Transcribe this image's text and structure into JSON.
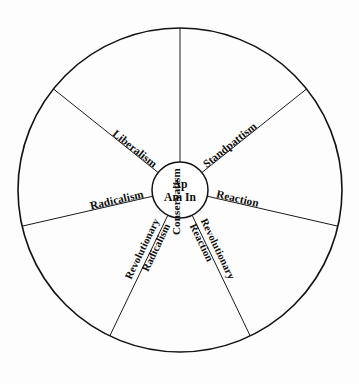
{
  "figure": {
    "name": "political-spectrum-wheel",
    "background_color": "#fdfdfd",
    "line_color": "#121212",
    "text_color": "#0d0d0d"
  },
  "hub": {
    "line1": "Ap",
    "line2": "Am In",
    "center_x": 180,
    "center_y": 190,
    "radius": 28
  },
  "wheel": {
    "center_x": 180,
    "center_y": 190,
    "radius": 162,
    "sector_count": 7
  },
  "sectors": [
    {
      "id": "conservatism",
      "label": "Conservatism",
      "lines": [
        "Conservatism"
      ],
      "spoke_angle_deg": 270,
      "label_rotation_deg": -90,
      "label_x": 180,
      "label_y": 162,
      "label_anchor": "end",
      "label_offset": 6
    },
    {
      "id": "standpattism",
      "label": "Standpattism",
      "lines": [
        "Standpattism"
      ],
      "spoke_angle_deg": 321.4,
      "label_rotation_deg": -38.6,
      "label_x": 202,
      "label_y": 172,
      "label_anchor": "start",
      "label_offset": 6
    },
    {
      "id": "reaction",
      "label": "Reaction",
      "lines": [
        "Reaction"
      ],
      "spoke_angle_deg": 12.9,
      "label_rotation_deg": 12.9,
      "label_x": 210,
      "label_y": 196,
      "label_anchor": "start",
      "label_offset": 6
    },
    {
      "id": "revolutionary-reaction",
      "label": "Revolutionary Reaction",
      "lines": [
        "Revolutionary",
        "Reaction"
      ],
      "spoke_angle_deg": 64.3,
      "label_rotation_deg": 64.3,
      "label_x": 196,
      "label_y": 216,
      "label_anchor": "start",
      "label_offset": 6
    },
    {
      "id": "revolutionary-radicalism",
      "label": "Revolutionary Radicalism",
      "lines": [
        "Revolutionary",
        "Radicalism"
      ],
      "spoke_angle_deg": 115.7,
      "label_rotation_deg": -64.3,
      "label_x": 164,
      "label_y": 216,
      "label_anchor": "end",
      "label_offset": 6
    },
    {
      "id": "radicalism",
      "label": "Radicalism",
      "lines": [
        "Radicalism"
      ],
      "spoke_angle_deg": 167.1,
      "label_rotation_deg": -12.9,
      "label_x": 150,
      "label_y": 196,
      "label_anchor": "end",
      "label_offset": 6
    },
    {
      "id": "liberalism",
      "label": "Liberalism",
      "lines": [
        "Liberalism"
      ],
      "spoke_angle_deg": 218.6,
      "label_rotation_deg": 38.6,
      "label_x": 158,
      "label_y": 172,
      "label_anchor": "end",
      "label_offset": 6
    }
  ]
}
